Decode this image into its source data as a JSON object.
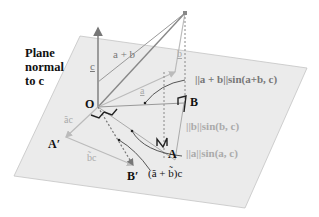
{
  "diagram": {
    "title_lines": [
      "Plane",
      "normal",
      "to c"
    ],
    "title_underlined_symbol": "c",
    "points": {
      "origin": "O",
      "A": "A",
      "B": "B",
      "A_prime": "A′",
      "B_prime": "B′"
    },
    "vector_labels": {
      "c": "c",
      "a_plus_b": "a + b",
      "a": "a",
      "b": "b",
      "a_tilde_c": "ãc",
      "b_tilde_c": "b̃c",
      "sum_tilde_c": "(ã + b̃)c"
    },
    "magnitude_labels": {
      "a_plus_b_sin": "||a + b||sin(a+b, c)",
      "b_sin": "||b||sin(b, c)",
      "a_sin": "||a||sin(a, c)"
    },
    "colors": {
      "plane_fill": "#ebebeb",
      "plane_edge": "#bbbbbb",
      "dark_line": "#777777",
      "light_line": "#bbbbbb",
      "text_dark": "#111111",
      "text_light": "#aaaaaa"
    }
  }
}
